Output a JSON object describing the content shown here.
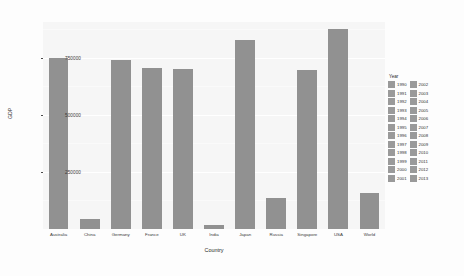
{
  "chart_data": {
    "type": "bar",
    "title": "",
    "xlabel": "Country",
    "ylabel": "GDP",
    "categories": [
      "Australia",
      "China",
      "Germany",
      "France",
      "UK",
      "India",
      "Japan",
      "Russia",
      "Singapore",
      "USA",
      "World"
    ],
    "values": [
      750000,
      45000,
      745000,
      710000,
      705000,
      18000,
      830000,
      135000,
      700000,
      880000,
      160000
    ],
    "series": [
      {
        "name": "GDP",
        "values": [
          750000,
          45000,
          745000,
          710000,
          705000,
          18000,
          830000,
          135000,
          700000,
          880000,
          160000
        ]
      }
    ],
    "ylim": [
      0,
      910000
    ],
    "yticks": [
      250000,
      500000,
      750000
    ],
    "ytick_labels": [
      "250000",
      "500000",
      "750000"
    ],
    "grid": true,
    "legend_position": "right",
    "bar_color": "#919191",
    "panel_background": "#f6f6f6",
    "gridline_color": "#ffffff"
  },
  "axes": {
    "y_title": "GDP",
    "x_title": "Country",
    "y_ticks": [
      {
        "label": "750000",
        "value": 750000
      },
      {
        "label": "500000",
        "value": 500000
      },
      {
        "label": "250000",
        "value": 250000
      }
    ],
    "x_ticks": [
      {
        "label": "Australia"
      },
      {
        "label": "China"
      },
      {
        "label": "Germany"
      },
      {
        "label": "France"
      },
      {
        "label": "UK"
      },
      {
        "label": "India"
      },
      {
        "label": "Japan"
      },
      {
        "label": "Russia"
      },
      {
        "label": "Singapore"
      },
      {
        "label": "USA"
      },
      {
        "label": "World"
      }
    ]
  },
  "legend": {
    "title": "Year",
    "column_1": [
      "1990",
      "1991",
      "1992",
      "1993",
      "1994",
      "1995",
      "1996",
      "1997",
      "1998",
      "1999",
      "2000",
      "2001"
    ],
    "column_2": [
      "2002",
      "2003",
      "2004",
      "2005",
      "2006",
      "2007",
      "2008",
      "2009",
      "2010",
      "2011",
      "2012",
      "2013"
    ],
    "swatch_color": "#9a9a9a"
  }
}
